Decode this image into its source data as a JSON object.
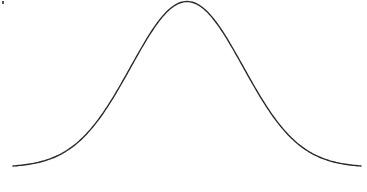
{
  "diagram": {
    "type": "normal-distribution-curve",
    "curve": {
      "function": "gaussian",
      "mean": 0,
      "std_dev": 1,
      "x_range": [
        -3.1,
        3.1
      ],
      "stroke_color": "#2a2a2a"
    },
    "background_color": "#ffffff"
  },
  "chart_data": {
    "type": "line",
    "title": "",
    "xlabel": "",
    "ylabel": "",
    "series": [
      {
        "name": "normal-pdf",
        "mean": 0,
        "std_dev": 1
      }
    ],
    "xlim": [
      -3.1,
      3.1
    ],
    "grid": false,
    "legend": "none"
  }
}
